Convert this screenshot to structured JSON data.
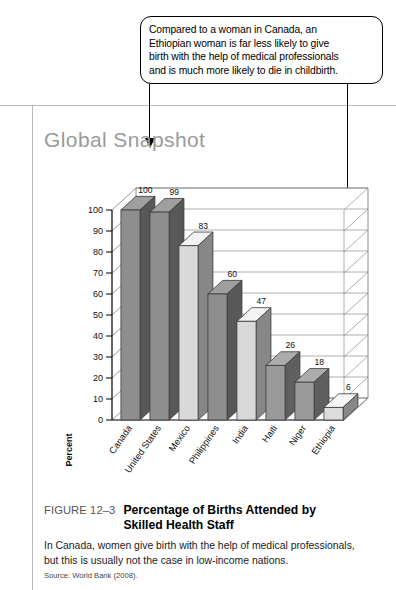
{
  "callout": {
    "lines": [
      "Compared to a woman in Canada, an",
      "Ethiopian woman is far less likely to give",
      "birth with the help of medical professionals",
      "and is much more likely to die in childbirth."
    ]
  },
  "chart_title": "Global Snapshot",
  "chart_data": {
    "type": "bar",
    "title": "Global Snapshot",
    "xlabel": "",
    "ylabel": "Percent",
    "ylim": [
      0,
      100
    ],
    "ytick_step": 10,
    "yticks": [
      "0",
      "10",
      "20",
      "30",
      "40",
      "50",
      "60",
      "70",
      "80",
      "90",
      "100"
    ],
    "grid": true,
    "legend": "none",
    "categories": [
      "Canada",
      "United States",
      "Mexico",
      "Philippines",
      "India",
      "Haiti",
      "Niger",
      "Ethiopia"
    ],
    "values": [
      100,
      99,
      83,
      60,
      47,
      26,
      18,
      6
    ],
    "bar_colors": [
      "#8e8e8e",
      "#8e8e8e",
      "#d9d9d9",
      "#8e8e8e",
      "#d9d9d9",
      "#9a9a9a",
      "#9a9a9a",
      "#dcdcdc"
    ],
    "annotations": [
      "Compared to a woman in Canada, an Ethiopian woman is far less likely to give birth with the help of medical professionals and is much more likely to die in childbirth."
    ]
  },
  "caption": {
    "figure_number": "FIGURE 12–3",
    "title_line1": "Percentage of Births Attended by",
    "title_line2": "Skilled Health Staff",
    "body_line1": "In Canada, women give birth with the help of medical professionals,",
    "body_line2": "but this is usually not the case in low-income nations.",
    "source": "Source: World Bank (2008)."
  },
  "colors": {
    "rule": "#b9b9b9",
    "title_gray": "#9a9a9a",
    "ink": "#000000"
  }
}
